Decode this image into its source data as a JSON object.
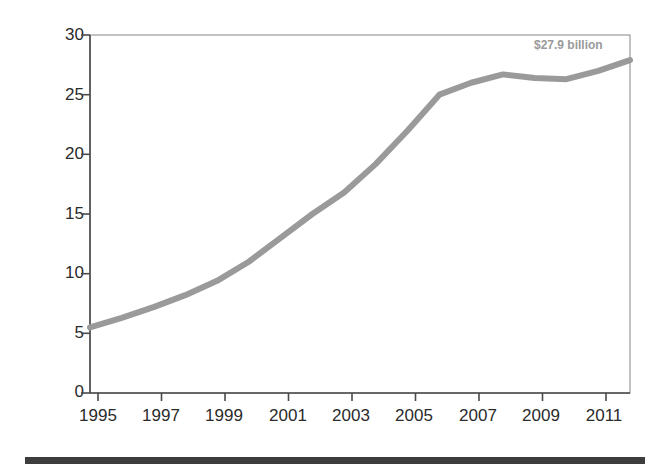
{
  "chart_data": {
    "type": "line",
    "title": "",
    "subtitle": "",
    "xlabel": "",
    "ylabel": "Revenue in Billions",
    "xlim": [
      1995,
      2012
    ],
    "ylim": [
      0,
      30
    ],
    "grid": false,
    "legend": null,
    "line_color": "#9a9a9a",
    "x": [
      1995,
      1996,
      1997,
      1998,
      1999,
      2000,
      2001,
      2002,
      2003,
      2004,
      2005,
      2006,
      2007,
      2008,
      2009,
      2010,
      2011,
      2012
    ],
    "values": [
      5.5,
      6.3,
      7.2,
      8.2,
      9.4,
      11.0,
      13.0,
      15.0,
      16.8,
      19.2,
      22.0,
      25.0,
      26.0,
      26.7,
      26.4,
      26.3,
      27.0,
      27.9
    ],
    "series": [
      {
        "name": "Revenue",
        "values": [
          5.5,
          6.3,
          7.2,
          8.2,
          9.4,
          11.0,
          13.0,
          15.0,
          16.8,
          19.2,
          22.0,
          25.0,
          26.0,
          26.7,
          26.4,
          26.3,
          27.0,
          27.9
        ]
      }
    ],
    "ytick_labels": [
      "0",
      "5",
      "10",
      "15",
      "20",
      "25",
      "30"
    ],
    "ytick_values": [
      0,
      5,
      10,
      15,
      20,
      25,
      30
    ],
    "xtick_labels": [
      "1995",
      "1997",
      "1999",
      "2001",
      "2003",
      "2005",
      "2007",
      "2009",
      "2011"
    ],
    "xtick_values": [
      1995,
      1997,
      1999,
      2001,
      2003,
      2005,
      2007,
      2009,
      2011
    ],
    "annotations": [
      {
        "text": "$27.9 billion",
        "x": 2012,
        "y": 29.0,
        "color": "#9a9a9a"
      }
    ]
  },
  "labels": {
    "y_axis_title": "Revenue in Billions",
    "end_value_annotation": "$27.9 billion",
    "ytick_0": "0",
    "ytick_5": "5",
    "ytick_10": "10",
    "ytick_15": "15",
    "ytick_20": "20",
    "ytick_25": "25",
    "ytick_30": "30",
    "xtick_1995": "1995",
    "xtick_1997": "1997",
    "xtick_1999": "1999",
    "xtick_2001": "2001",
    "xtick_2003": "2003",
    "xtick_2005": "2005",
    "xtick_2007": "2007",
    "xtick_2009": "2009",
    "xtick_2011": "2011"
  },
  "colors": {
    "line": "#9a9a9a",
    "axis": "#4a4a4a",
    "text": "#2b2b2b",
    "rule_bar": "#3d3d3d"
  }
}
